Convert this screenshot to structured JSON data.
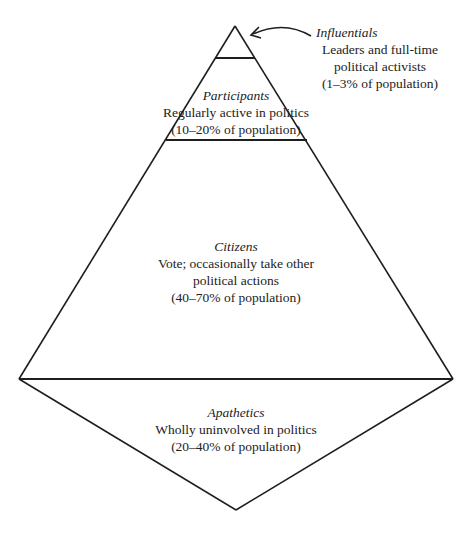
{
  "diagram": {
    "type": "population pyramid of political participation",
    "line_color": "#1e1e1e",
    "background": "#ffffff",
    "tiers": [
      {
        "name": "Influentials",
        "description_lines": [
          "Leaders and full-time",
          "political activists"
        ],
        "share": "(1–3% of population)"
      },
      {
        "name": "Participants",
        "description_lines": [
          "Regularly active in politics"
        ],
        "share": "(10–20% of population)"
      },
      {
        "name": "Citizens",
        "description_lines": [
          "Vote; occasionally take other",
          "political actions"
        ],
        "share": "(40–70% of population)"
      },
      {
        "name": "Apathetics",
        "description_lines": [
          "Wholly uninvolved in politics"
        ],
        "share": "(20–40% of population)"
      }
    ],
    "arrow": {
      "from": "Influentials label",
      "to": "pyramid apex",
      "icon": "curved-arrow-icon"
    }
  }
}
